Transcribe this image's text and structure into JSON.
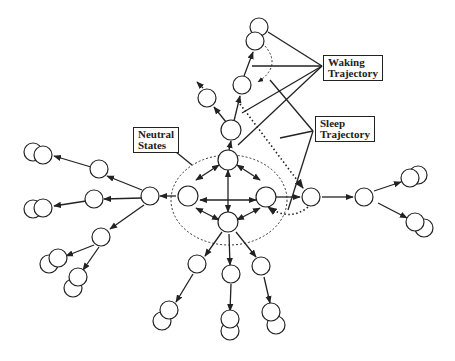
{
  "diagram": {
    "labels": {
      "waking": [
        "Waking",
        "Trajectory"
      ],
      "sleep": [
        "Sleep",
        "Trajectory"
      ],
      "neutral": [
        "Neutral",
        "States"
      ]
    },
    "colors": {
      "stroke": "#222222",
      "background": "#ffffff"
    }
  }
}
